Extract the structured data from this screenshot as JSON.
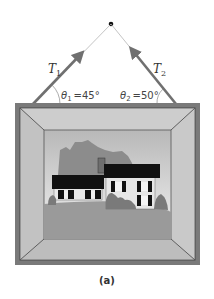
{
  "figure": {
    "caption": "(a)",
    "tension_left": {
      "symbol": "T",
      "subscript": "1"
    },
    "tension_right": {
      "symbol": "T",
      "subscript": "2"
    },
    "angle_left": {
      "symbol": "θ",
      "subscript": "1",
      "value": "=45°"
    },
    "angle_right": {
      "symbol": "θ",
      "subscript": "2",
      "value": "=50°"
    },
    "colors": {
      "arrow": "#707070",
      "string": "#b0b0b0",
      "frame_outer": "#7a7a7a",
      "frame_bevel": "#c4c4c4",
      "roof": "#111111",
      "sky_top": "#bdbdbd",
      "sky_bottom": "#f0f0f0",
      "ground": "#9a9a9a",
      "trees": "#7a7a7a"
    }
  }
}
